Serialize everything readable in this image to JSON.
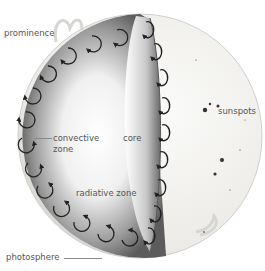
{
  "diagram": {
    "labels": {
      "prominence": "prominence",
      "sunspots": "sunspots",
      "convective_zone_line1": "convective",
      "convective_zone_line2": "zone",
      "core": "core",
      "radiative_zone": "radiative zone",
      "photosphere": "photosphere"
    },
    "colors": {
      "background": "#ffffff",
      "surface": "#efefec",
      "cutaway_shadow": "#6e6e6e",
      "arrows": "#222222",
      "label_text": "#555555"
    }
  }
}
